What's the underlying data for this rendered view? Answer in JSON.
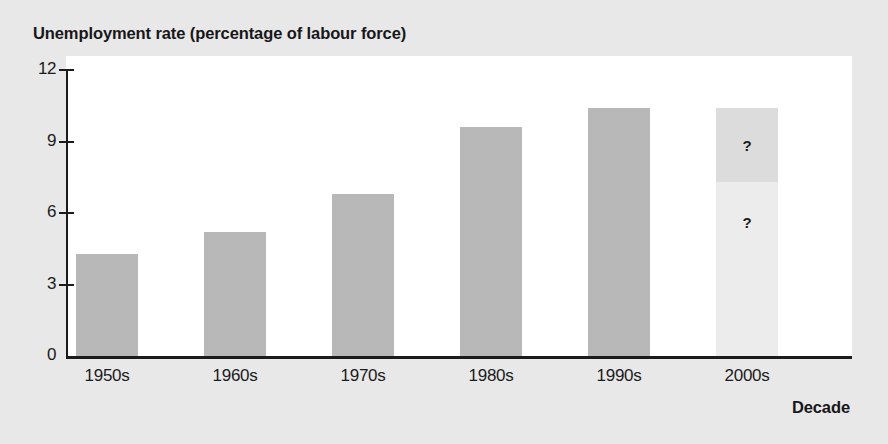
{
  "chart_data": {
    "type": "bar",
    "title": "Unemployment rate (percentage of labour force)",
    "xlabel": "Decade",
    "ylabel": "",
    "categories": [
      "1950s",
      "1960s",
      "1970s",
      "1980s",
      "1990s",
      "2000s"
    ],
    "values": [
      4.3,
      5.2,
      6.8,
      9.6,
      10.4,
      10.4
    ],
    "yticks": [
      "0",
      "3",
      "6",
      "9",
      "12"
    ],
    "ytick_values": [
      0,
      3,
      6,
      9,
      12
    ],
    "ylim": [
      0,
      12
    ],
    "grid": false,
    "legend": null,
    "series": [
      {
        "name": "Unemployment rate",
        "values": [
          4.3,
          5.2,
          6.8,
          9.6,
          10.4,
          10.4
        ]
      }
    ],
    "bars": [
      {
        "category": "1950s",
        "value": 4.3,
        "projected": false,
        "color": "#b8b8b8"
      },
      {
        "category": "1960s",
        "value": 5.2,
        "projected": false,
        "color": "#b8b8b8"
      },
      {
        "category": "1970s",
        "value": 6.8,
        "projected": false,
        "color": "#b8b8b8"
      },
      {
        "category": "1980s",
        "value": 9.6,
        "projected": false,
        "color": "#b8b8b8"
      },
      {
        "category": "1990s",
        "value": 10.4,
        "projected": false,
        "color": "#b8b8b8"
      },
      {
        "category": "2000s",
        "value": 10.4,
        "projected": true,
        "color": "#dcdcdc",
        "segment_split": 7.3,
        "upper_color": "#dcdcdc",
        "lower_color": "#ececec",
        "annotations": [
          "?",
          "?"
        ]
      }
    ],
    "annotations": [
      {
        "text": "?",
        "category": "2000s",
        "value": 8.8
      },
      {
        "text": "?",
        "category": "2000s",
        "value": 5.6
      }
    ]
  },
  "colors": {
    "page_background": "#e8e8e8",
    "plot_background": "#ffffff",
    "bar_fill": "#b8b8b8",
    "projection_upper": "#dcdcdc",
    "projection_lower": "#ececec",
    "axis": "#1b1b1b",
    "text": "#17171a"
  }
}
